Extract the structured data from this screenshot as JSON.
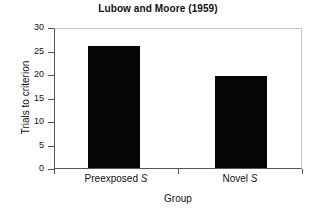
{
  "chart_data": {
    "type": "bar",
    "title": "Lubow and Moore (1959)",
    "xlabel": "Group",
    "ylabel": "Trials to criterion",
    "categories": [
      "Preexposed S",
      "Novel S"
    ],
    "category_labels_html": [
      "Preexposed <i>S</i>",
      "Novel <i>S</i>"
    ],
    "values": [
      26,
      19.5
    ],
    "ylim": [
      0,
      30
    ],
    "yticks": [
      0,
      5,
      10,
      15,
      20,
      25,
      30
    ],
    "ytick_labels": [
      "0",
      "5",
      "10",
      "15",
      "20",
      "25",
      "30"
    ],
    "grid": false,
    "legend": "none",
    "bar_color": "#050505",
    "background_color": "#ffffff",
    "axis_color": "#555555",
    "frame_color": "#c8c8c8"
  }
}
